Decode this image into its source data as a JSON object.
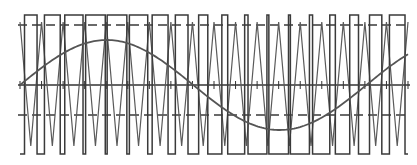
{
  "diagram": {
    "title": "",
    "type": "sinusoidal PWM waveform",
    "width": 417,
    "height": 165,
    "colors": {
      "background": "#ffffff",
      "pulse": "#3a3a3a",
      "carrier": "#5a5a5a",
      "sine": "#555555",
      "axis": "#333333",
      "dashed": "#3a3a3a"
    },
    "geometry": {
      "x_start": 20,
      "x_end": 408,
      "axis_y": 85,
      "pulse_high_y": 15,
      "pulse_low_y": 154,
      "upper_dashed_y": 25,
      "lower_dashed_y": 115,
      "carrier_peak_y": 22,
      "carrier_trough_y": 146,
      "sine_amplitude_px": 45,
      "carrier_periods": 18,
      "sine_cycles": 1.12,
      "tick_half_length": 4
    },
    "elements": [
      {
        "name": "modulating-sine-wave",
        "label": "reference sine"
      },
      {
        "name": "triangle-carrier-wave",
        "label": "carrier triangle"
      },
      {
        "name": "pwm-pulse-train",
        "label": "PWM output"
      },
      {
        "name": "zero-axis",
        "label": "axis"
      },
      {
        "name": "upper-dashed-reference",
        "label": "upper level"
      },
      {
        "name": "lower-dashed-reference",
        "label": "lower level"
      }
    ]
  }
}
